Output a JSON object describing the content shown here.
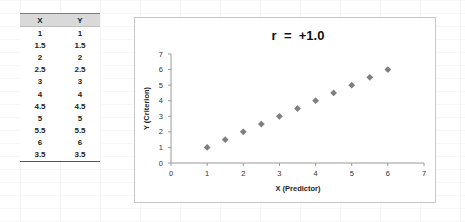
{
  "table": {
    "headers": [
      "X",
      "Y"
    ],
    "rows": [
      [
        "1",
        "1"
      ],
      [
        "1.5",
        "1.5"
      ],
      [
        "2",
        "2"
      ],
      [
        "2.5",
        "2.5"
      ],
      [
        "3",
        "3"
      ],
      [
        "4",
        "4"
      ],
      [
        "4.5",
        "4.5"
      ],
      [
        "5",
        "5"
      ],
      [
        "5.5",
        "5.5"
      ],
      [
        "6",
        "6"
      ],
      [
        "3.5",
        "3.5"
      ]
    ]
  },
  "chart_data": {
    "type": "scatter",
    "title": "r  =  +1.0",
    "xlabel": "X (Predictor)",
    "ylabel": "Y (Criterion)",
    "xlim": [
      0,
      7
    ],
    "ylim": [
      0,
      7
    ],
    "x_ticks": [
      "0",
      "1",
      "2",
      "3",
      "4",
      "5",
      "6",
      "7"
    ],
    "y_ticks": [
      "0",
      "1",
      "2",
      "3",
      "4",
      "5",
      "6",
      "7"
    ],
    "grid": false,
    "legend": null,
    "marker": "diamond",
    "marker_color": "#7f7f7f",
    "series": [
      {
        "name": "Y",
        "points": [
          [
            1,
            1
          ],
          [
            1.5,
            1.5
          ],
          [
            2,
            2
          ],
          [
            2.5,
            2.5
          ],
          [
            3,
            3
          ],
          [
            4,
            4
          ],
          [
            4.5,
            4.5
          ],
          [
            5,
            5
          ],
          [
            5.5,
            5.5
          ],
          [
            6,
            6
          ],
          [
            3.5,
            3.5
          ]
        ]
      }
    ]
  }
}
